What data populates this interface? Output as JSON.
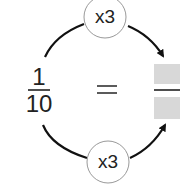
{
  "diagram": {
    "left_fraction": {
      "numerator": "1",
      "denominator": "10"
    },
    "equals": "=",
    "right_fraction": {
      "numerator": "",
      "denominator": "",
      "blank": true,
      "box_color": "#d8d8d8"
    },
    "top_operator": "x3",
    "bottom_operator": "x3",
    "line_color": "#111111"
  }
}
